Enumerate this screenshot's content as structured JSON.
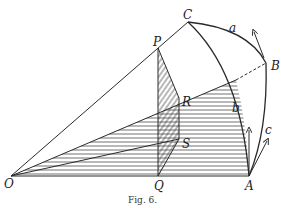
{
  "figure": {
    "caption": "Fig. 6.",
    "labels": {
      "O": "O",
      "Q": "Q",
      "A": "A",
      "P": "P",
      "C": "C",
      "B": "B",
      "R": "R",
      "S": "S",
      "a": "a",
      "b": "b",
      "c": "c"
    },
    "colors": {
      "ink": "#2a2a2a",
      "background": "#ffffff"
    }
  }
}
